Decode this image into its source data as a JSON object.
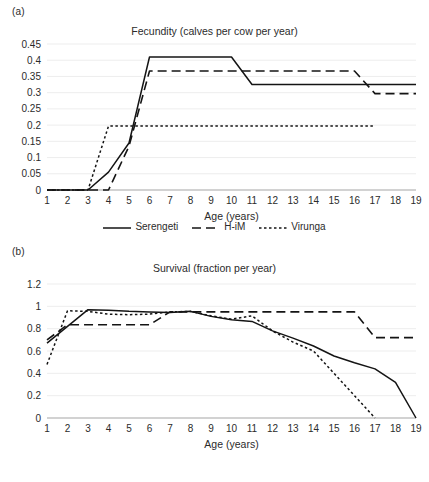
{
  "figure": {
    "panels": [
      {
        "panel_label": "(a)",
        "title": "Fecundity (calves per cow per year)"
      },
      {
        "panel_label": "(b)",
        "title": "Survival (fraction per year)"
      }
    ]
  },
  "legend": {
    "items": [
      {
        "label": "Serengeti",
        "style": "solid",
        "color": "#141414"
      },
      {
        "label": "H-iM",
        "style": "dashed",
        "color": "#141414"
      },
      {
        "label": "Virunga",
        "style": "dotted",
        "color": "#141414"
      }
    ]
  },
  "chart_data": [
    {
      "type": "line",
      "panel": "(a)",
      "title": "Fecundity (calves per cow per year)",
      "xlabel": "Age (years)",
      "ylabel": "",
      "xlim": [
        1,
        19
      ],
      "ylim": [
        0,
        0.45
      ],
      "xticks": [
        1,
        2,
        3,
        4,
        5,
        6,
        7,
        8,
        9,
        10,
        11,
        12,
        13,
        14,
        15,
        16,
        17,
        18,
        19
      ],
      "yticks": [
        0,
        0.05,
        0.1,
        0.15,
        0.2,
        0.25,
        0.3,
        0.35,
        0.4,
        0.45
      ],
      "ytick_labels": [
        "0",
        "0.05",
        "0.1",
        "0.15",
        "0.2",
        "0.25",
        "0.3",
        "0.35",
        "0.4",
        "0.45"
      ],
      "grid": true,
      "legend_position": "bottom",
      "x": [
        1,
        2,
        3,
        4,
        5,
        6,
        7,
        8,
        9,
        10,
        11,
        12,
        13,
        14,
        15,
        16,
        17,
        18,
        19
      ],
      "series": [
        {
          "name": "Serengeti",
          "style": "solid",
          "values": [
            0,
            0,
            0,
            0.055,
            0.145,
            0.41,
            0.41,
            0.41,
            0.41,
            0.41,
            0.325,
            0.325,
            0.325,
            0.325,
            0.325,
            0.325,
            0.325,
            0.325,
            0.325
          ]
        },
        {
          "name": "H-iM",
          "style": "dashed",
          "values": [
            0,
            0,
            0,
            0,
            0.135,
            0.367,
            0.367,
            0.367,
            0.367,
            0.367,
            0.367,
            0.367,
            0.367,
            0.367,
            0.367,
            0.367,
            0.297,
            0.297,
            0.297
          ]
        },
        {
          "name": "Virunga",
          "style": "dotted",
          "values": [
            0,
            0,
            0,
            0.197,
            0.197,
            0.197,
            0.197,
            0.197,
            0.197,
            0.197,
            0.197,
            0.197,
            0.197,
            0.197,
            0.197,
            0.197,
            0.197,
            null,
            null
          ]
        }
      ]
    },
    {
      "type": "line",
      "panel": "(b)",
      "title": "Survival (fraction per year)",
      "xlabel": "Age (years)",
      "ylabel": "",
      "xlim": [
        1,
        19
      ],
      "ylim": [
        0,
        1.2
      ],
      "xticks": [
        1,
        2,
        3,
        4,
        5,
        6,
        7,
        8,
        9,
        10,
        11,
        12,
        13,
        14,
        15,
        16,
        17,
        18,
        19
      ],
      "yticks": [
        0,
        0.2,
        0.4,
        0.6,
        0.8,
        1,
        1.2
      ],
      "ytick_labels": [
        "0",
        "0.2",
        "0.4",
        "0.6",
        "0.8",
        "1",
        "1.2"
      ],
      "grid": true,
      "legend_position": "bottom",
      "x": [
        1,
        2,
        3,
        4,
        5,
        6,
        7,
        8,
        9,
        10,
        11,
        12,
        13,
        14,
        15,
        16,
        17,
        18,
        19
      ],
      "series": [
        {
          "name": "Serengeti",
          "style": "solid",
          "values": [
            0.67,
            0.82,
            0.97,
            0.965,
            0.955,
            0.95,
            0.945,
            0.955,
            0.91,
            0.88,
            0.865,
            0.78,
            0.715,
            0.645,
            0.555,
            0.495,
            0.44,
            0.32,
            0
          ]
        },
        {
          "name": "H-iM",
          "style": "dashed",
          "values": [
            0.7,
            0.835,
            0.835,
            0.835,
            0.835,
            0.835,
            0.95,
            0.95,
            0.95,
            0.95,
            0.95,
            0.95,
            0.95,
            0.95,
            0.95,
            0.95,
            0.72,
            0.72,
            0.72
          ]
        },
        {
          "name": "Virunga",
          "style": "dotted",
          "values": [
            0.48,
            0.96,
            0.955,
            0.93,
            0.925,
            0.93,
            0.95,
            0.955,
            0.915,
            0.885,
            0.915,
            0.78,
            0.68,
            0.6,
            0.4,
            0.2,
            0,
            null,
            null
          ]
        }
      ]
    }
  ]
}
